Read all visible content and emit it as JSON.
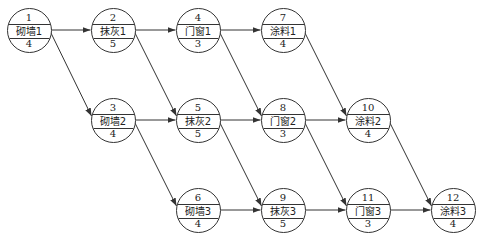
{
  "diagram": {
    "type": "activity-on-node network",
    "line_color": "#333333",
    "nodes": [
      {
        "id": "1",
        "label": "砌墙1",
        "duration": "4",
        "cx": 29,
        "cy": 30
      },
      {
        "id": "2",
        "label": "抹灰1",
        "duration": "5",
        "cx": 113,
        "cy": 30
      },
      {
        "id": "4",
        "label": "门窗1",
        "duration": "3",
        "cx": 198,
        "cy": 30
      },
      {
        "id": "7",
        "label": "涂料1",
        "duration": "4",
        "cx": 283,
        "cy": 30
      },
      {
        "id": "3",
        "label": "砌墙2",
        "duration": "4",
        "cx": 113,
        "cy": 120
      },
      {
        "id": "5",
        "label": "抹灰2",
        "duration": "5",
        "cx": 198,
        "cy": 120
      },
      {
        "id": "8",
        "label": "门窗2",
        "duration": "3",
        "cx": 283,
        "cy": 120
      },
      {
        "id": "10",
        "label": "涂料2",
        "duration": "4",
        "cx": 368,
        "cy": 120
      },
      {
        "id": "6",
        "label": "砌墙3",
        "duration": "4",
        "cx": 198,
        "cy": 210
      },
      {
        "id": "9",
        "label": "抹灰3",
        "duration": "5",
        "cx": 283,
        "cy": 210
      },
      {
        "id": "11",
        "label": "门窗3",
        "duration": "3",
        "cx": 368,
        "cy": 210
      },
      {
        "id": "12",
        "label": "涂料3",
        "duration": "4",
        "cx": 453,
        "cy": 210
      }
    ],
    "edges": [
      {
        "from": "1",
        "to": "2"
      },
      {
        "from": "2",
        "to": "4"
      },
      {
        "from": "4",
        "to": "7"
      },
      {
        "from": "3",
        "to": "5"
      },
      {
        "from": "5",
        "to": "8"
      },
      {
        "from": "8",
        "to": "10"
      },
      {
        "from": "6",
        "to": "9"
      },
      {
        "from": "9",
        "to": "11"
      },
      {
        "from": "11",
        "to": "12"
      },
      {
        "from": "1",
        "to": "3"
      },
      {
        "from": "2",
        "to": "5"
      },
      {
        "from": "4",
        "to": "8"
      },
      {
        "from": "7",
        "to": "10"
      },
      {
        "from": "3",
        "to": "6"
      },
      {
        "from": "5",
        "to": "9"
      },
      {
        "from": "8",
        "to": "11"
      },
      {
        "from": "10",
        "to": "12"
      }
    ]
  }
}
